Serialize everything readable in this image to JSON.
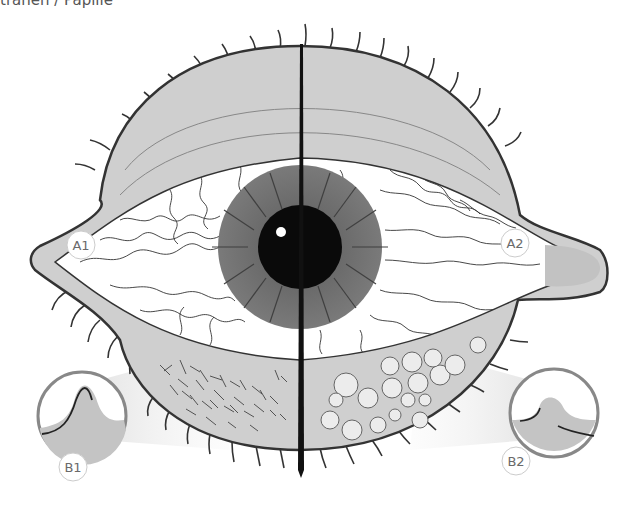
{
  "caption": "tränen / Papille",
  "labels": {
    "a1": "A1",
    "a2": "A2",
    "b1": "B1",
    "b2": "B2"
  },
  "colors": {
    "lid_fill": "#c9c9c9",
    "lid_stroke": "#3a3a3a",
    "iris": "#6f6f6f",
    "pupil": "#0a0a0a",
    "divider": "#111111",
    "sclera": "#ffffff",
    "gland": "#e8e8e8"
  },
  "diagram": {
    "left_side": [
      "A1",
      "B1"
    ],
    "right_side": [
      "A2",
      "B2"
    ]
  }
}
